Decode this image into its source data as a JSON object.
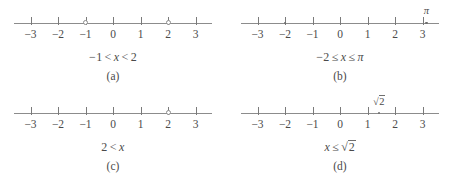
{
  "figure": {
    "background_color": "#ffffff",
    "line_color": "#8c8c8c",
    "text_color": "#4a4a4a",
    "axis_min": -3.6,
    "axis_max": 3.6,
    "tick_values": [
      -3,
      -2,
      -1,
      0,
      1,
      2,
      3
    ],
    "tick_labels": [
      "−3",
      "−2",
      "−1",
      "0",
      "1",
      "2",
      "3"
    ]
  },
  "panels": [
    {
      "id": "a",
      "sublabel": "(a)",
      "expression": "−1 < x < 2",
      "expr_parts": {
        "left_value": "−1",
        "left_rel": "<",
        "variable": "x",
        "right_rel": "<",
        "right_value": "2"
      },
      "markers": [
        {
          "name": "open-endpoint-minus-1",
          "value": -1,
          "type": "open",
          "label": ""
        },
        {
          "name": "open-endpoint-2",
          "value": 2,
          "type": "open",
          "label": ""
        }
      ]
    },
    {
      "id": "b",
      "sublabel": "(b)",
      "expression": "−2 ≤ x ≤ π",
      "expr_parts": {
        "left_value": "−2",
        "left_rel": "≤",
        "variable": "x",
        "right_rel": "≤",
        "right_value": "π"
      },
      "markers": [
        {
          "name": "closed-endpoint-minus-2",
          "value": -2,
          "type": "closed",
          "label": ""
        },
        {
          "name": "closed-endpoint-pi",
          "value": 3.14159,
          "type": "closed",
          "label": "π"
        }
      ]
    },
    {
      "id": "c",
      "sublabel": "(c)",
      "expression": "2 < x",
      "expr_parts": {
        "left_value": "2",
        "left_rel": "<",
        "variable": "x",
        "right_rel": "",
        "right_value": ""
      },
      "markers": [
        {
          "name": "open-endpoint-2",
          "value": 2,
          "type": "open",
          "label": ""
        }
      ]
    },
    {
      "id": "d",
      "sublabel": "(d)",
      "expression": "x ≤ √2",
      "expr_parts": {
        "left_value": "x",
        "left_rel": "≤",
        "variable": "",
        "right_rel": "",
        "right_value": "√2",
        "radicand": "2"
      },
      "markers": [
        {
          "name": "closed-endpoint-sqrt2",
          "value": 1.41421,
          "type": "closed",
          "label": "√2",
          "radicand": "2"
        }
      ]
    }
  ]
}
